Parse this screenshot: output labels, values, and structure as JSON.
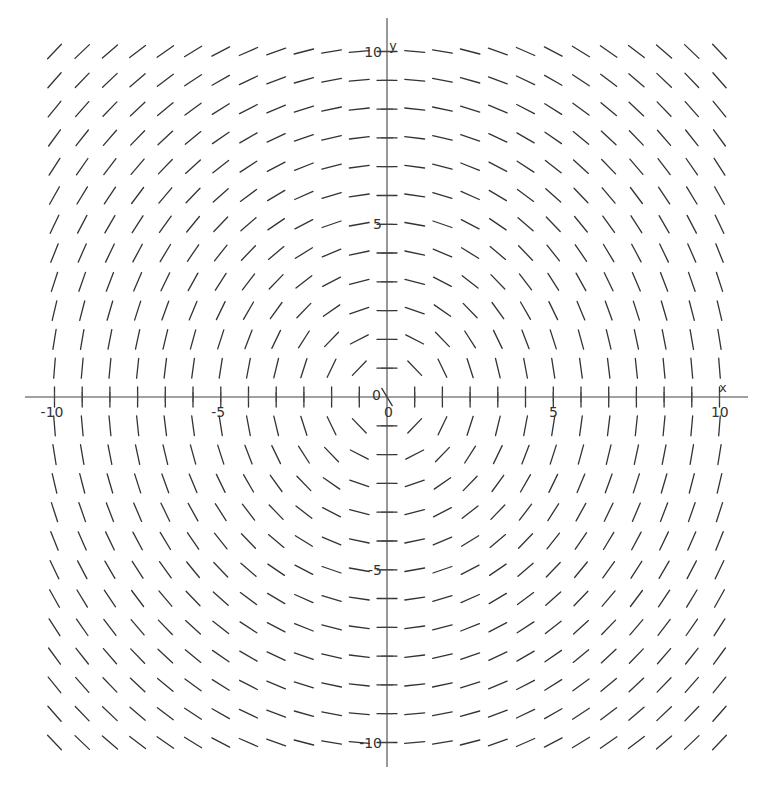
{
  "chart_data": {
    "type": "slope_field",
    "title": "",
    "equation": "dy/dx = -x/y",
    "xlabel": "x",
    "ylabel": "y",
    "xlim": [
      -10,
      10
    ],
    "ylim": [
      -10,
      10
    ],
    "grid": false,
    "grid_points_per_axis": 25,
    "x_ticks": [
      {
        "value": -10,
        "label": "-10"
      },
      {
        "value": -5,
        "label": "-5"
      },
      {
        "value": 0,
        "label": "0"
      },
      {
        "value": 5,
        "label": "5"
      },
      {
        "value": 10,
        "label": "10"
      }
    ],
    "y_ticks": [
      {
        "value": -10,
        "label": "-10"
      },
      {
        "value": -5,
        "label": "-5"
      },
      {
        "value": 0,
        "label": "0"
      },
      {
        "value": 5,
        "label": "5"
      },
      {
        "value": 10,
        "label": "10"
      }
    ],
    "minor_tick_step": 0.8333,
    "segment_color": "#333333",
    "axis_color": "#444444"
  }
}
